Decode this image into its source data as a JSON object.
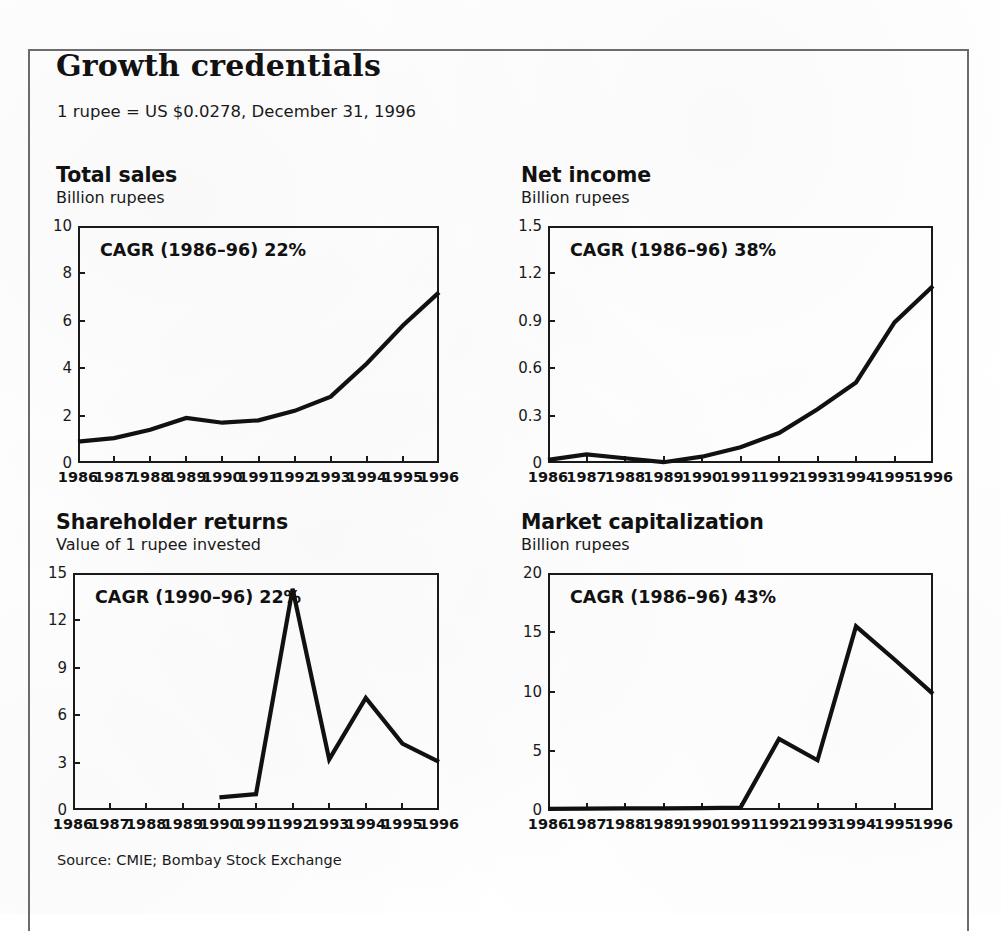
{
  "header": {
    "title": "Growth credentials",
    "exchange_note": "1 rupee = US $0.0278, December 31, 1996"
  },
  "source": "Source: CMIE; Bombay Stock Exchange",
  "colors": {
    "ink": "#111111",
    "frame_rule": "#6b6b6b",
    "background": "#ffffff"
  },
  "chart_data": [
    {
      "id": "total-sales",
      "type": "line",
      "title": "Total sales",
      "subtitle": "Billion rupees",
      "annotation": "CAGR (1986–96) 22%",
      "xlabel": "",
      "ylabel": "Billion rupees",
      "grid": false,
      "legend": "none",
      "categories": [
        "1986",
        "1987",
        "1988",
        "1989",
        "1990",
        "1991",
        "1992",
        "1993",
        "1994",
        "1995",
        "1996"
      ],
      "yticks": [
        0,
        2,
        4,
        6,
        8,
        10
      ],
      "ytick_labels": [
        "0",
        "2",
        "4",
        "6",
        "8",
        "10"
      ],
      "ylim": [
        0,
        10
      ],
      "values": [
        0.9,
        1.05,
        1.4,
        1.9,
        1.7,
        1.8,
        2.2,
        2.8,
        4.2,
        5.8,
        7.2
      ]
    },
    {
      "id": "net-income",
      "type": "line",
      "title": "Net income",
      "subtitle": "Billion rupees",
      "annotation": "CAGR (1986–96) 38%",
      "xlabel": "",
      "ylabel": "Billion rupees",
      "grid": false,
      "legend": "none",
      "categories": [
        "1986",
        "1987",
        "1988",
        "1989",
        "1990",
        "1991",
        "1992",
        "1993",
        "1994",
        "1995",
        "1996"
      ],
      "yticks": [
        0,
        0.3,
        0.6,
        0.9,
        1.2,
        1.5
      ],
      "ytick_labels": [
        "0",
        "0.3",
        "0.6",
        "0.9",
        "1.2",
        "1.5"
      ],
      "ylim": [
        0,
        1.5
      ],
      "values": [
        0.02,
        0.055,
        0.03,
        0.005,
        0.04,
        0.1,
        0.19,
        0.34,
        0.51,
        0.89,
        1.12
      ]
    },
    {
      "id": "shareholder-returns",
      "type": "line",
      "title": "Shareholder returns",
      "subtitle": "Value of 1 rupee invested",
      "annotation": "CAGR (1990–96) 22%",
      "xlabel": "",
      "ylabel": "Value of 1 rupee invested",
      "grid": false,
      "legend": "none",
      "categories": [
        "1986",
        "1987",
        "1988",
        "1989",
        "1990",
        "1991",
        "1992",
        "1993",
        "1994",
        "1995",
        "1996"
      ],
      "yticks": [
        0,
        3,
        6,
        9,
        12,
        15
      ],
      "ytick_labels": [
        "0",
        "3",
        "6",
        "9",
        "12",
        "15"
      ],
      "ylim": [
        0,
        15
      ],
      "values": [
        null,
        null,
        null,
        null,
        0.8,
        1.0,
        14.0,
        3.2,
        7.1,
        4.2,
        3.05
      ]
    },
    {
      "id": "market-capitalization",
      "type": "line",
      "title": "Market capitalization",
      "subtitle": "Billion rupees",
      "annotation": "CAGR (1986–96) 43%",
      "xlabel": "",
      "ylabel": "Billion rupees",
      "grid": false,
      "legend": "none",
      "categories": [
        "1986",
        "1987",
        "1988",
        "1989",
        "1990",
        "1991",
        "1992",
        "1993",
        "1994",
        "1995",
        "1996"
      ],
      "yticks": [
        0,
        5,
        10,
        15,
        20
      ],
      "ytick_labels": [
        "0",
        "5",
        "10",
        "15",
        "20"
      ],
      "ylim": [
        0,
        20
      ],
      "values": [
        0.1,
        0.12,
        0.13,
        0.14,
        0.16,
        0.2,
        6.0,
        4.2,
        15.5,
        12.7,
        9.8
      ]
    }
  ],
  "layout": {
    "panels": [
      {
        "id": "total-sales",
        "title_x": 56,
        "title_y": 163,
        "sub_y": 188,
        "plot_x": 78,
        "plot_y": 226,
        "plot_w": 361,
        "plot_h": 237,
        "ylab_right": 72,
        "xlab_y": 469
      },
      {
        "id": "net-income",
        "title_x": 521,
        "title_y": 163,
        "sub_y": 188,
        "plot_x": 548,
        "plot_y": 226,
        "plot_w": 385,
        "plot_h": 237,
        "ylab_right": 542,
        "xlab_y": 469
      },
      {
        "id": "shareholder-returns",
        "title_x": 56,
        "title_y": 510,
        "sub_y": 535,
        "plot_x": 73,
        "plot_y": 573,
        "plot_w": 366,
        "plot_h": 237,
        "ylab_right": 67,
        "xlab_y": 816
      },
      {
        "id": "market-capitalization",
        "title_x": 521,
        "title_y": 510,
        "sub_y": 535,
        "plot_x": 548,
        "plot_y": 573,
        "plot_w": 385,
        "plot_h": 237,
        "ylab_right": 542,
        "xlab_y": 816
      }
    ]
  }
}
